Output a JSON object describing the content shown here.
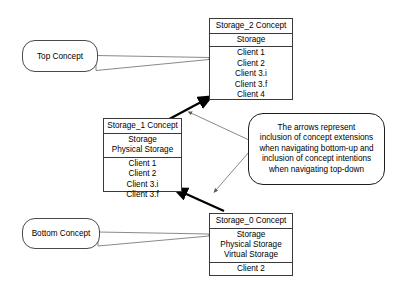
{
  "diagram": {
    "background_color": "#ffffff",
    "line_color": "#3a3a3a",
    "arrow_color": "#000000"
  },
  "concepts": [
    {
      "id": "storage-2",
      "title": "Storage_2 Concept",
      "intent": [
        "Storage"
      ],
      "extent": [
        "Client 1",
        "Client 2",
        "Client 3.i",
        "Client 3.f",
        "Client 4"
      ]
    },
    {
      "id": "storage-1",
      "title": "Storage_1 Concept",
      "intent": [
        "Storage",
        "Physical Storage"
      ],
      "extent": [
        "Client 1",
        "Client 2",
        "Client 3.i",
        "Client 3.f"
      ]
    },
    {
      "id": "storage-0",
      "title": "Storage_0 Concept",
      "intent": [
        "Storage",
        "Physical Storage",
        "Virtual Storage"
      ],
      "extent": [
        "Client 2"
      ]
    }
  ],
  "callouts": [
    {
      "id": "top-concept",
      "label": "Top Concept",
      "points_to": "storage-2"
    },
    {
      "id": "bottom-concept",
      "label": "Bottom Concept",
      "points_to": "storage-0"
    }
  ],
  "annotation": {
    "id": "arrow-legend",
    "lines": [
      "The arrows represent",
      "inclusion of concept extensions",
      "when navigating bottom-up and",
      "inclusion of concept intentions",
      "when navigating top-down"
    ]
  },
  "arrows": [
    {
      "id": "arrow-storage1-to-storage2",
      "from": "storage-1",
      "to": "storage-2",
      "style": "thick"
    },
    {
      "id": "arrow-storage0-to-storage1",
      "from": "storage-0",
      "to": "storage-1",
      "style": "thick"
    }
  ]
}
